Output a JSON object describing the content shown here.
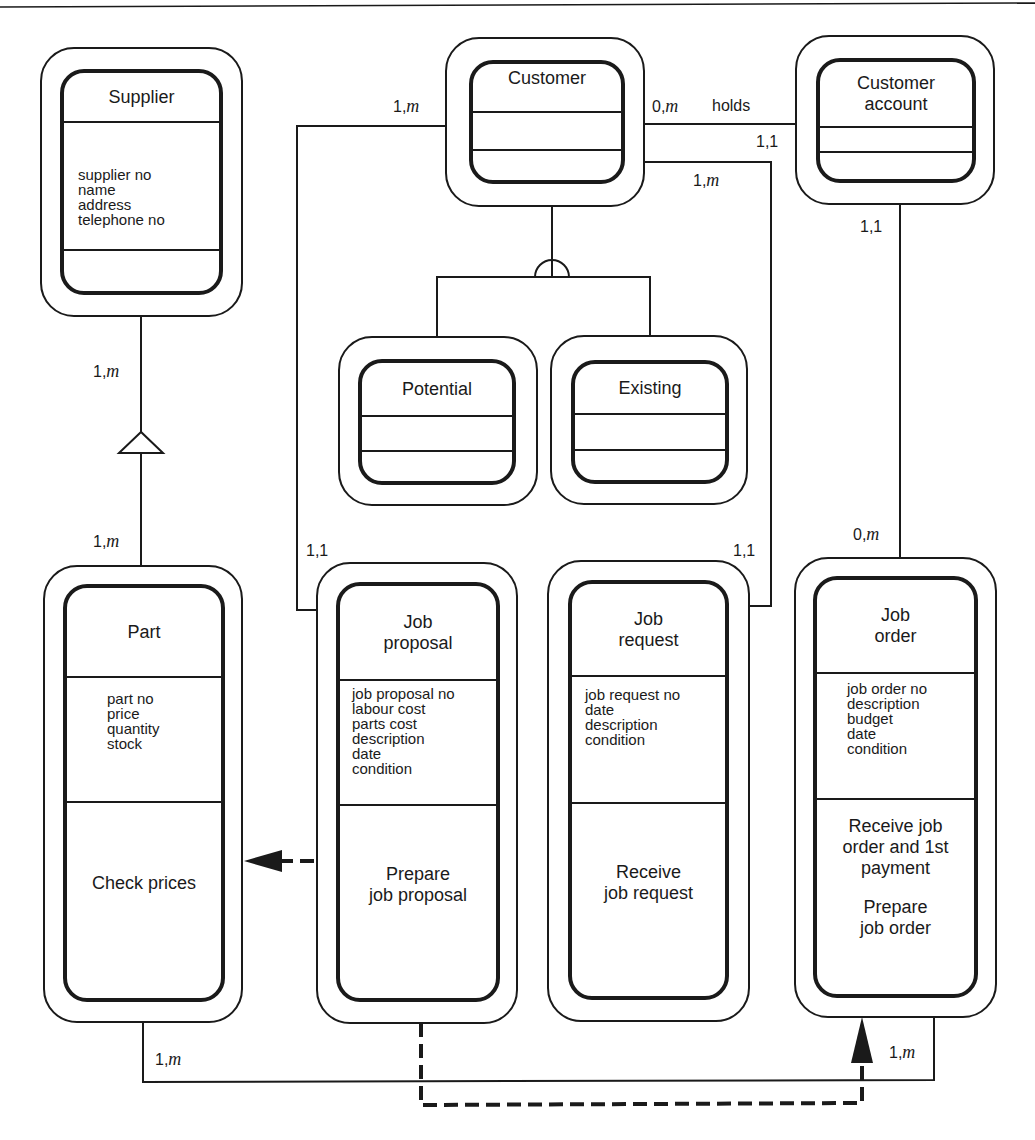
{
  "diagram": {
    "type": "object-oriented class / ER diagram",
    "classes": {
      "supplier": {
        "name": "Supplier",
        "attributes": [
          "supplier no",
          "name",
          "address",
          "telephone no"
        ],
        "operations": []
      },
      "customer": {
        "name": "Customer",
        "attributes": [],
        "operations": []
      },
      "customer_account": {
        "name": "Customer\naccount",
        "attributes": [],
        "operations": []
      },
      "potential": {
        "name": "Potential",
        "attributes": [],
        "operations": []
      },
      "existing": {
        "name": "Existing",
        "attributes": [],
        "operations": []
      },
      "part": {
        "name": "Part",
        "attributes": [
          "part no",
          "price",
          "quantity",
          "stock"
        ],
        "operations": [
          "Check prices"
        ]
      },
      "job_proposal": {
        "name": "Job\nproposal",
        "attributes": [
          "job proposal no",
          "labour cost",
          "parts cost",
          "description",
          "date",
          "condition"
        ],
        "operations": [
          "Prepare\njob proposal"
        ]
      },
      "job_request": {
        "name": "Job\nrequest",
        "attributes": [
          "job request no",
          "date",
          "description",
          "condition"
        ],
        "operations": [
          "Receive\njob request"
        ]
      },
      "job_order": {
        "name": "Job\norder",
        "attributes": [
          "job order no",
          "description",
          "budget",
          "date",
          "condition"
        ],
        "operations": [
          "Receive job\norder and 1st\npayment",
          "Prepare\njob order"
        ]
      }
    },
    "relations": [
      {
        "from": "Customer",
        "to": "Job proposal",
        "type": "association",
        "from_card": "1,m",
        "to_card": "1,1"
      },
      {
        "from": "Customer",
        "to": "Customer account",
        "type": "association",
        "label": "holds",
        "from_card": "0,m",
        "to_card": "1,1"
      },
      {
        "from": "Customer",
        "to": "Job request",
        "type": "association",
        "from_card": "1,m",
        "to_card": "1,1"
      },
      {
        "from": "Customer account",
        "to": "Job order",
        "type": "association",
        "from_card": "1,1",
        "to_card": "0,m"
      },
      {
        "from": "Supplier",
        "to": "Part",
        "type": "whole-part",
        "from_card": "1,m",
        "to_card": "1,m"
      },
      {
        "from": "Customer",
        "to": [
          "Potential",
          "Existing"
        ],
        "type": "generalisation-specialisation"
      },
      {
        "from": "Part",
        "to": "Job order",
        "type": "association",
        "from_card": "1,m",
        "to_card": "1,m"
      },
      {
        "from": "Job proposal",
        "to": "Part",
        "type": "message-connection"
      },
      {
        "from": "Job proposal",
        "to": "Job order",
        "type": "message-connection"
      }
    ],
    "labels": {
      "cust_jp_top": "1,",
      "cust_holds_from": "0,",
      "holds": "holds",
      "holds_to": "1,1",
      "cust_jr_top": "1,",
      "acct_jo_top": "1,1",
      "acct_jo_bottom": "0,",
      "supplier_part_top": "1,",
      "supplier_part_bottom": "1,",
      "jp_card": "1,1",
      "jr_card": "1,1",
      "part_jo_left": "1,",
      "part_jo_right": "1,",
      "m": "m"
    }
  }
}
